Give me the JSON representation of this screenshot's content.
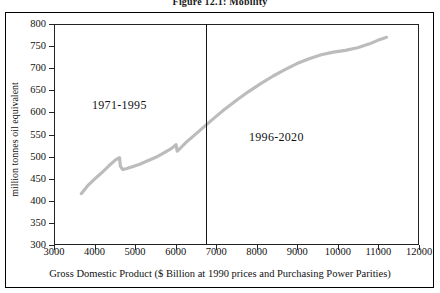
{
  "figure": {
    "caption": "Figure 12.1:  Mobility"
  },
  "axes": {
    "y": {
      "title": "million tonnes oil equivalent",
      "ticks": [
        300,
        350,
        400,
        450,
        500,
        550,
        600,
        650,
        700,
        750,
        800
      ],
      "min": 300,
      "max": 800
    },
    "x": {
      "title": "Gross Domestic Product ($ Billion at 1990 prices and Purchasing Power Parities)",
      "ticks": [
        3000,
        4000,
        5000,
        6000,
        7000,
        8000,
        9000,
        10000,
        11000,
        12000
      ],
      "min": 3000,
      "max": 12000
    }
  },
  "annotations": [
    {
      "name": "period-historical",
      "text": "1971-1995",
      "x": 4600,
      "y": 620
    },
    {
      "name": "period-projection",
      "text": "1996-2020",
      "x": 8600,
      "y": 545
    }
  ],
  "divider": {
    "x": 6750
  },
  "colors": {
    "series": "#bcbcbc",
    "axis": "#222222",
    "frame": "#000000",
    "text": "#111111"
  },
  "chart_data": {
    "type": "line",
    "title": "Figure 12.1:  Mobility",
    "xlabel": "Gross Domestic Product ($ Billion at 1990 prices and Purchasing Power Parities)",
    "ylabel": "million tonnes oil equivalent",
    "xlim": [
      3000,
      12000
    ],
    "ylim": [
      300,
      800
    ],
    "grid": false,
    "legend": null,
    "series": [
      {
        "name": "Mobility energy use vs GDP",
        "x": [
          3650,
          3800,
          3980,
          4150,
          4330,
          4500,
          4600,
          4620,
          4680,
          4760,
          4900,
          5100,
          5300,
          5500,
          5700,
          5900,
          6000,
          6030,
          6100,
          6250,
          6450,
          6600,
          6750,
          6950,
          7200,
          7500,
          7800,
          8100,
          8400,
          8700,
          9000,
          9300,
          9600,
          9900,
          10200,
          10500,
          10800,
          11000,
          11150,
          11220
        ],
        "y": [
          415,
          432,
          448,
          462,
          478,
          492,
          497,
          478,
          470,
          472,
          476,
          482,
          490,
          498,
          508,
          519,
          527,
          512,
          518,
          532,
          548,
          560,
          572,
          588,
          607,
          628,
          648,
          666,
          683,
          698,
          712,
          723,
          732,
          738,
          742,
          748,
          757,
          765,
          770,
          772
        ]
      }
    ]
  }
}
